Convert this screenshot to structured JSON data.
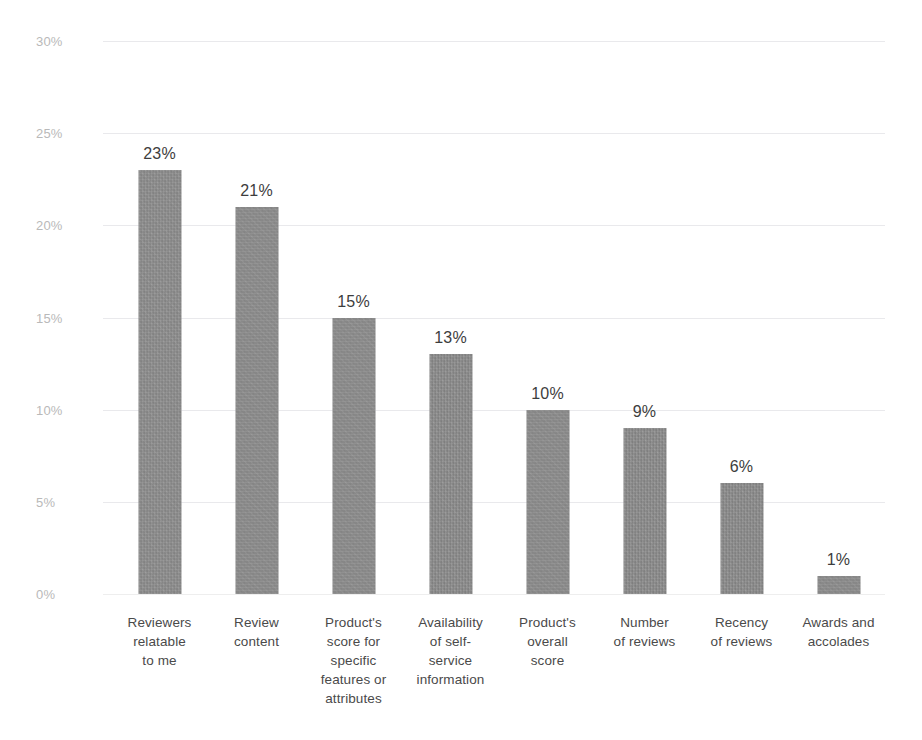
{
  "chart_data": {
    "type": "bar",
    "title": "",
    "subtitle": "",
    "xlabel": "",
    "ylabel": "",
    "ylim": [
      0,
      30
    ],
    "yunit": "%",
    "grid": true,
    "legend": false,
    "orientation": "vertical",
    "bar_color": "#8d8d8d",
    "label_color": "#3d3d3d",
    "gridline_color": "#e9e9ec",
    "tick_color": "#b9b9b9",
    "background": "#ffffff",
    "categories": [
      "Reviewers relatable to me",
      "Review content",
      "Product's score for specific features or attributes",
      "Availability of self-service information",
      "Product's overall score",
      "Number of reviews",
      "Recency of reviews",
      "Awards and accolades"
    ],
    "category_lines": [
      [
        "Reviewers",
        "relatable",
        "to me"
      ],
      [
        "Review",
        "content"
      ],
      [
        "Product's",
        "score for",
        "specific",
        "features or",
        "attributes"
      ],
      [
        "Availability",
        "of self-",
        "service",
        "information"
      ],
      [
        "Product's",
        "overall",
        "score"
      ],
      [
        "Number",
        "of reviews"
      ],
      [
        "Recency",
        "of reviews"
      ],
      [
        "Awards and",
        "accolades"
      ]
    ],
    "values": [
      23,
      21,
      15,
      13,
      10,
      9,
      6,
      1
    ],
    "value_labels": [
      "23%",
      "21%",
      "15%",
      "13%",
      "10%",
      "9%",
      "6%",
      "1%"
    ],
    "yticks": [
      30,
      25,
      20,
      15,
      10,
      5,
      0
    ],
    "ytick_labels": [
      "30%",
      "25%",
      "20%",
      "15%",
      "10%",
      "5%",
      "0%"
    ]
  }
}
